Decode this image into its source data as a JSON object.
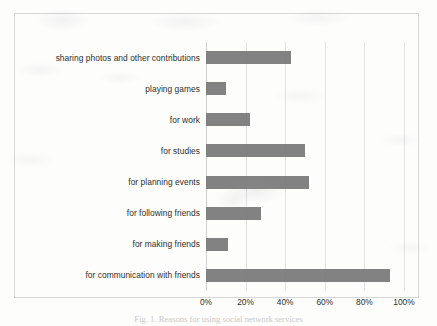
{
  "chart_data": {
    "type": "bar",
    "orientation": "horizontal",
    "title": "",
    "xlabel": "",
    "ylabel": "",
    "xlim": [
      0,
      100
    ],
    "grid": true,
    "legend": false,
    "bar_color": "#787878",
    "categories": [
      "sharing photos and other contributions",
      "playing games",
      "for work",
      "for studies",
      "for planning events",
      "for following friends",
      "for making friends",
      "for communication with friends"
    ],
    "values": [
      43,
      10,
      22,
      50,
      52,
      28,
      11,
      93
    ],
    "xticks": [
      0,
      20,
      40,
      60,
      80,
      100
    ],
    "xticklabels": [
      "0%",
      "20%",
      "40%",
      "60%",
      "80%",
      "100%"
    ]
  },
  "caption": {
    "text": "Fig. 1. Reasons for using social network services"
  }
}
